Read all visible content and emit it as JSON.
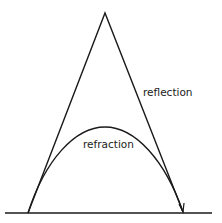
{
  "diagram": {
    "labels": {
      "reflection": "reflection",
      "refraction": "refraction"
    },
    "colors": {
      "stroke": "#1a1a1a",
      "background": "#ffffff",
      "text": "#222222"
    }
  }
}
